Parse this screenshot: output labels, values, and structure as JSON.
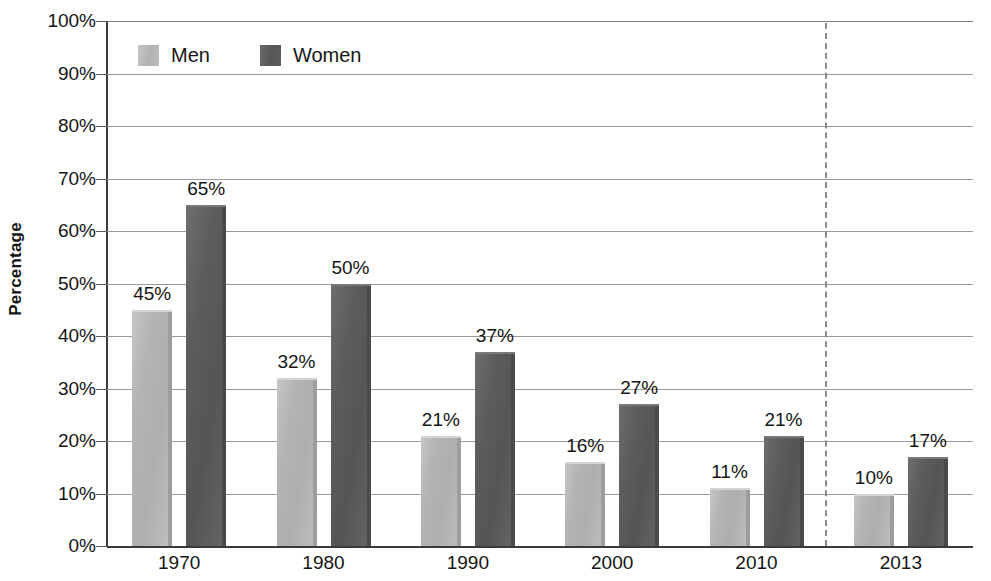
{
  "chart_data": {
    "type": "bar",
    "title": "",
    "xlabel": "",
    "ylabel": "Percentage",
    "ylim": [
      0,
      100
    ],
    "grid": true,
    "legend_position": "top-left",
    "categories": [
      "1970",
      "1980",
      "1990",
      "2000",
      "2010",
      "2013"
    ],
    "series": [
      {
        "name": "Men",
        "color": "#b4b4b4",
        "values": [
          45,
          32,
          21,
          16,
          11,
          10
        ],
        "labels": [
          "45%",
          "32%",
          "21%",
          "16%",
          "11%",
          "10%"
        ]
      },
      {
        "name": "Women",
        "color": "#5a5a5a",
        "values": [
          65,
          50,
          37,
          27,
          21,
          17
        ],
        "labels": [
          "65%",
          "50%",
          "37%",
          "27%",
          "21%",
          "17%"
        ]
      }
    ],
    "y_ticks": [
      {
        "value": 100,
        "label": "100%"
      },
      {
        "value": 90,
        "label": "90%"
      },
      {
        "value": 80,
        "label": "80%"
      },
      {
        "value": 70,
        "label": "70%"
      },
      {
        "value": 60,
        "label": "60%"
      },
      {
        "value": 50,
        "label": "50%"
      },
      {
        "value": 40,
        "label": "40%"
      },
      {
        "value": 30,
        "label": "30%"
      },
      {
        "value": 20,
        "label": "20%"
      },
      {
        "value": 10,
        "label": "10%"
      },
      {
        "value": 0,
        "label": "0%"
      }
    ],
    "annotations": [
      {
        "type": "vertical-dashed-line",
        "after_category": "2010",
        "x_fraction": 0.829
      }
    ]
  },
  "legend": {
    "entries": [
      {
        "label": "Men",
        "swatch": "men-swatch"
      },
      {
        "label": "Women",
        "swatch": "women-swatch"
      }
    ]
  },
  "axis": {
    "y_title": "Percentage"
  }
}
